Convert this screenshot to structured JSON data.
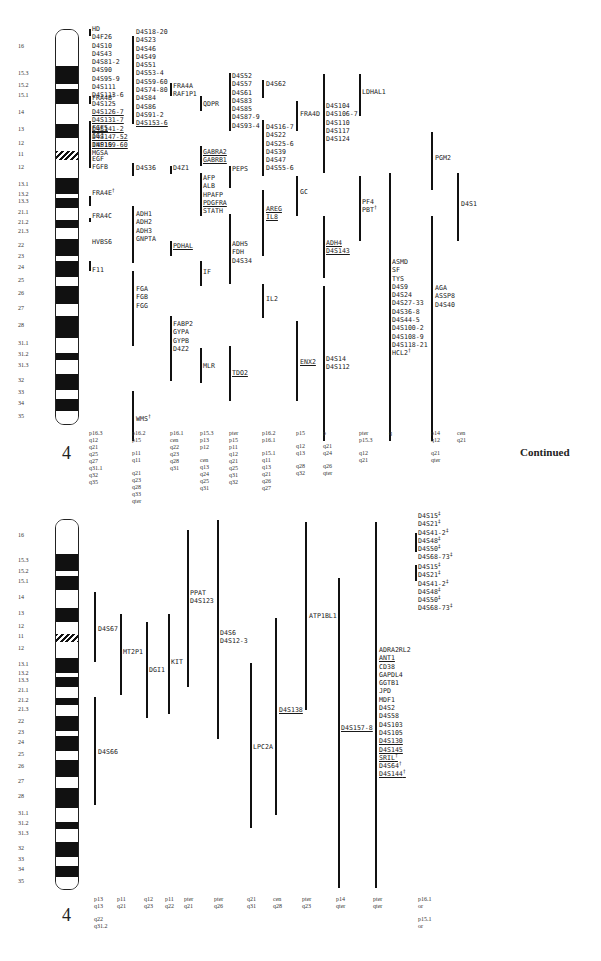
{
  "chromosome": "4",
  "continued_label": "Continued",
  "band_labels": [
    "16",
    "15.3",
    "15.2",
    "15.1",
    "14",
    "13",
    "12",
    "11",
    "12",
    "13.1",
    "13.2",
    "13.3",
    "21.1",
    "21.2",
    "21.3",
    "22",
    "23",
    "24",
    "25",
    "26",
    "27",
    "28",
    "31.1",
    "31.2",
    "31.3",
    "32",
    "33",
    "34",
    "35"
  ],
  "panel1": {
    "columns": [
      {
        "id": "c1",
        "groups": [
          {
            "genes": [
              {
                "t": "HD"
              },
              {
                "t": "D4F26"
              },
              {
                "t": "D4S10"
              },
              {
                "t": "D4S43"
              },
              {
                "t": "D4S81-2"
              },
              {
                "t": "D4S90"
              },
              {
                "t": "D4S95-9"
              },
              {
                "t": "D4S111"
              },
              {
                "t": "D4S113-6"
              },
              {
                "t": "D4S125"
              },
              {
                "t": "D4S126-7",
                "u": true
              },
              {
                "t": "D4S131-7",
                "u": true
              },
              {
                "t": "D4S141-2",
                "u": true
              },
              {
                "t": "D4S147-52",
                "u": true
              },
              {
                "t": "D4S159-60",
                "u": true
              }
            ]
          },
          {
            "genes": [
              {
                "t": "FRA4B",
                "sup": "†"
              }
            ]
          },
          {
            "genes": [
              {
                "t": "FGF5",
                "u": true
              },
              {
                "t": "IGJ"
              },
              {
                "t": "INP10"
              },
              {
                "t": "MGSA"
              }
            ]
          },
          {
            "genes": [
              {
                "t": "EGF"
              },
              {
                "t": "FGFB"
              }
            ]
          },
          {
            "genes": [
              {
                "t": "FRA4E",
                "sup": "†"
              }
            ]
          },
          {
            "genes": [
              {
                "t": "FRA4C"
              }
            ]
          },
          {
            "genes": [
              {
                "t": "HVBS6"
              }
            ]
          },
          {
            "genes": [
              {
                "t": "F11"
              }
            ]
          }
        ],
        "regions": [
          "p16.3",
          "q12",
          "q21",
          "q25",
          "q27",
          "q31.1",
          "q32",
          "q35"
        ]
      },
      {
        "id": "c2",
        "groups": [
          {
            "genes": [
              {
                "t": "D4S18-20"
              },
              {
                "t": "D4S23"
              },
              {
                "t": "D4S46"
              },
              {
                "t": "D4S49"
              },
              {
                "t": "D4S51"
              },
              {
                "t": "D4S53-4"
              },
              {
                "t": "D4S59-60"
              },
              {
                "t": "D4S74-80"
              },
              {
                "t": "D4S84"
              },
              {
                "t": "D4S86"
              },
              {
                "t": "D4S91-2"
              },
              {
                "t": "D4S153-6",
                "u": true
              }
            ]
          },
          {
            "genes": [
              {
                "t": "D4S36"
              }
            ]
          },
          {
            "genes": [
              {
                "t": "ADH1"
              },
              {
                "t": "ADH2"
              },
              {
                "t": "ADH3"
              },
              {
                "t": "GNPTA"
              }
            ]
          },
          {
            "genes": [
              {
                "t": "FGA"
              },
              {
                "t": "FGB"
              },
              {
                "t": "FGG"
              }
            ]
          },
          {
            "genes": [
              {
                "t": "WMS",
                "sup": "†"
              }
            ]
          }
        ],
        "regions": [
          "p16.2",
          "p15",
          "p11",
          "q11",
          "q21",
          "q23",
          "q28",
          "q33",
          "qter"
        ]
      },
      {
        "id": "c3",
        "groups": [
          {
            "genes": [
              {
                "t": "FRA4A"
              },
              {
                "t": "RAF1P1"
              }
            ]
          },
          {
            "genes": [
              {
                "t": "D4Z1"
              }
            ]
          },
          {
            "genes": [
              {
                "t": "PDHAL",
                "u": true
              }
            ]
          },
          {
            "genes": [
              {
                "t": "FABP2"
              },
              {
                "t": "GYPA"
              },
              {
                "t": "GYPB"
              },
              {
                "t": "D4Z2"
              }
            ]
          }
        ],
        "regions": [
          "p16.1",
          "cen",
          "q22",
          "q23",
          "q28",
          "q31"
        ]
      },
      {
        "id": "c4",
        "groups": [
          {
            "genes": [
              {
                "t": "QDPR"
              }
            ]
          },
          {
            "genes": [
              {
                "t": "GABRA2",
                "u": true
              },
              {
                "t": "GABRB1",
                "u": true
              }
            ]
          },
          {
            "genes": [
              {
                "t": "AFP"
              },
              {
                "t": "ALB"
              },
              {
                "t": "HPAFP"
              },
              {
                "t": "PDGFRA",
                "u": true
              },
              {
                "t": "STATH"
              }
            ]
          },
          {
            "genes": [
              {
                "t": "IF"
              }
            ]
          },
          {
            "genes": [
              {
                "t": "MLR"
              }
            ]
          }
        ],
        "regions": [
          "p15.3",
          "p13",
          "p12",
          "cen",
          "q13",
          "q24",
          "q25",
          "q31"
        ]
      },
      {
        "id": "c5",
        "groups": [
          {
            "genes": [
              {
                "t": "D4S52"
              },
              {
                "t": "D4S57"
              },
              {
                "t": "D4S61"
              },
              {
                "t": "D4S83"
              },
              {
                "t": "D4S85"
              },
              {
                "t": "D4S87-9"
              },
              {
                "t": "D4S93-4"
              }
            ]
          },
          {
            "genes": [
              {
                "t": "PEPS"
              }
            ]
          },
          {
            "genes": [
              {
                "t": "ADH5"
              },
              {
                "t": "FDH"
              },
              {
                "t": "D4S34"
              }
            ]
          },
          {
            "genes": [
              {
                "t": "TDO2",
                "u": true
              }
            ]
          }
        ],
        "regions": [
          "pter",
          "p15",
          "p11",
          "q12",
          "q21",
          "q25",
          "q31",
          "q32"
        ]
      },
      {
        "id": "c6",
        "groups": [
          {
            "genes": [
              {
                "t": "D4S62"
              }
            ]
          },
          {
            "genes": [
              {
                "t": "D4S16-7"
              },
              {
                "t": "D4S22"
              },
              {
                "t": "D4S25-6"
              },
              {
                "t": "D4S39"
              },
              {
                "t": "D4S47"
              },
              {
                "t": "D4S55-6"
              }
            ]
          },
          {
            "genes": [
              {
                "t": "AREG",
                "u": true
              },
              {
                "t": "IL8",
                "u": true
              }
            ]
          },
          {
            "genes": [
              {
                "t": "IL2"
              }
            ]
          }
        ],
        "regions": [
          "p16.2",
          "p16.1",
          "p15.1",
          "q11",
          "q13",
          "q21",
          "q26",
          "q27"
        ]
      },
      {
        "id": "c7",
        "groups": [
          {
            "genes": [
              {
                "t": "FRA4D"
              }
            ]
          },
          {
            "genes": [
              {
                "t": "GC"
              }
            ]
          },
          {
            "genes": [
              {
                "t": "ENX2",
                "u": true
              }
            ]
          }
        ],
        "regions": [
          "p15",
          "q12",
          "q13",
          "q28",
          "q32"
        ]
      },
      {
        "id": "c8",
        "groups": [
          {
            "genes": [
              {
                "t": "D4S104"
              },
              {
                "t": "D4S106-7"
              },
              {
                "t": "D4S110"
              },
              {
                "t": "D4S117"
              },
              {
                "t": "D4S124"
              }
            ]
          },
          {
            "genes": [
              {
                "t": "ADH4",
                "u": true
              },
              {
                "t": "D4S143",
                "u": true
              }
            ]
          },
          {
            "genes": [
              {
                "t": "D4S14"
              },
              {
                "t": "D4S112"
              }
            ]
          }
        ],
        "regions": [
          "p",
          "q21",
          "q24",
          "q26",
          "qter"
        ]
      },
      {
        "id": "c9",
        "groups": [
          {
            "genes": [
              {
                "t": "LDHAL1"
              }
            ]
          },
          {
            "genes": [
              {
                "t": "PF4"
              },
              {
                "t": "PBT",
                "sup": "†"
              }
            ]
          }
        ],
        "regions": [
          "pter",
          "p15.3",
          "q12",
          "q21"
        ]
      },
      {
        "id": "c10",
        "groups": [
          {
            "genes": [
              {
                "t": "ASMD"
              },
              {
                "t": "SF"
              },
              {
                "t": "TYS"
              },
              {
                "t": "D4S9"
              },
              {
                "t": "D4S24"
              },
              {
                "t": "D4S27-33"
              },
              {
                "t": "D4S36-8"
              },
              {
                "t": "D4S44-5"
              },
              {
                "t": "D4S100-2"
              },
              {
                "t": "D4S108-9"
              },
              {
                "t": "D4S118-21"
              },
              {
                "t": "HCL2",
                "sup": "†"
              }
            ]
          }
        ],
        "regions": [
          "q"
        ]
      },
      {
        "id": "c11",
        "groups": [
          {
            "genes": [
              {
                "t": "PGM2"
              }
            ]
          },
          {
            "genes": [
              {
                "t": "AGA"
              },
              {
                "t": "ASSP8"
              },
              {
                "t": "D4S40"
              }
            ]
          }
        ],
        "regions": [
          "p14",
          "q12",
          "q21",
          "qter"
        ]
      },
      {
        "id": "c12",
        "groups": [
          {
            "genes": [
              {
                "t": "D4S1"
              }
            ]
          }
        ],
        "regions": [
          "cen",
          "q21"
        ]
      }
    ]
  },
  "panel2": {
    "columns": [
      {
        "id": "d1",
        "groups": [
          {
            "genes": [
              {
                "t": "D4S67"
              }
            ]
          },
          {
            "genes": [
              {
                "t": "D4S66"
              }
            ]
          }
        ],
        "regions": [
          "p13",
          "q13",
          "q22",
          "q31.2"
        ]
      },
      {
        "id": "d2",
        "groups": [
          {
            "genes": [
              {
                "t": "MT2P1"
              }
            ]
          }
        ],
        "regions": [
          "p11",
          "q21"
        ]
      },
      {
        "id": "d3",
        "groups": [
          {
            "genes": [
              {
                "t": "DGI1"
              }
            ]
          }
        ],
        "regions": [
          "q12",
          "q23"
        ]
      },
      {
        "id": "d4",
        "groups": [
          {
            "genes": [
              {
                "t": "KIT"
              }
            ]
          }
        ],
        "regions": [
          "p11",
          "q22"
        ]
      },
      {
        "id": "d5",
        "groups": [
          {
            "genes": [
              {
                "t": "PPAT"
              },
              {
                "t": "D4S123"
              }
            ]
          }
        ],
        "regions": [
          "pter",
          "q21"
        ]
      },
      {
        "id": "d6",
        "groups": [
          {
            "genes": [
              {
                "t": "D4S6"
              },
              {
                "t": "D4S12-3"
              }
            ]
          }
        ],
        "regions": [
          "pter",
          "q26"
        ]
      },
      {
        "id": "d7",
        "groups": [
          {
            "genes": [
              {
                "t": "LPC2A"
              }
            ]
          }
        ],
        "regions": [
          "q21",
          "q31"
        ]
      },
      {
        "id": "d8",
        "groups": [
          {
            "genes": [
              {
                "t": "D4S138",
                "u": true
              }
            ]
          }
        ],
        "regions": [
          "cen",
          "q28"
        ]
      },
      {
        "id": "d9",
        "groups": [
          {
            "genes": [
              {
                "t": "ATP1BL1"
              }
            ]
          }
        ],
        "regions": [
          "pter",
          "q23"
        ]
      },
      {
        "id": "d10",
        "groups": [
          {
            "genes": [
              {
                "t": "D4S157-8",
                "u": true
              }
            ]
          }
        ],
        "regions": [
          "p14",
          "qter"
        ]
      },
      {
        "id": "d11",
        "groups": [
          {
            "genes": [
              {
                "t": "ADRA2RL2"
              },
              {
                "t": "ANT1",
                "u": true
              },
              {
                "t": "CD38"
              },
              {
                "t": "GAPDL4"
              },
              {
                "t": "GGTB1"
              },
              {
                "t": "JPD"
              },
              {
                "t": "MDF1"
              },
              {
                "t": "D4S2"
              },
              {
                "t": "D4S58"
              },
              {
                "t": "D4S103"
              },
              {
                "t": "D4S105"
              },
              {
                "t": "D4S130",
                "u": true
              },
              {
                "t": "D4S145",
                "u": true
              },
              {
                "t": "SRIL",
                "u": true,
                "sup": "†"
              },
              {
                "t": "D4S64",
                "sup": "†"
              },
              {
                "t": "D4S144",
                "u": true,
                "sup": "†"
              }
            ]
          }
        ],
        "regions": [
          "pter",
          "qter"
        ]
      },
      {
        "id": "d12",
        "groups": [
          {
            "genes": [
              {
                "t": "D4S15",
                "sup": "‡"
              },
              {
                "t": "D4S21",
                "sup": "‡"
              },
              {
                "t": "D4S41-2",
                "sup": "‡"
              },
              {
                "t": "D4S48",
                "sup": "‡"
              },
              {
                "t": "D4S50",
                "sup": "‡"
              },
              {
                "t": "D4S68-73",
                "sup": "‡"
              }
            ]
          },
          {
            "genes": [
              {
                "t": "D4S15",
                "sup": "‡"
              },
              {
                "t": "D4S21",
                "sup": "‡"
              },
              {
                "t": "D4S41-2",
                "sup": "‡"
              },
              {
                "t": "D4S48",
                "sup": "‡"
              },
              {
                "t": "D4S50",
                "sup": "‡"
              },
              {
                "t": "D4S68-73",
                "sup": "‡"
              }
            ]
          }
        ],
        "regions": [
          "p16.1",
          "or",
          "p15.1",
          "or"
        ]
      }
    ]
  }
}
